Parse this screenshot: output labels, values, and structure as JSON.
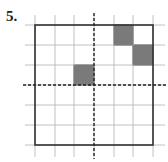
{
  "problem": {
    "number_label": "5."
  },
  "grid": {
    "columns": 6,
    "rows": 6,
    "x_lines": [
      35,
      55,
      74,
      94,
      114,
      133,
      153
    ],
    "y_lines": [
      25,
      45,
      65,
      85,
      105,
      125,
      145
    ],
    "line_color": "#b0b0b0",
    "border_color": "#333333",
    "fill_color": "#7a7a7a"
  },
  "axes_of_symmetry": {
    "vertical_x": 94,
    "horizontal_y": 85,
    "style": "dashed"
  },
  "shaded_cells": [
    {
      "col": 4,
      "row": 0
    },
    {
      "col": 5,
      "row": 1
    },
    {
      "col": 2,
      "row": 2
    }
  ]
}
